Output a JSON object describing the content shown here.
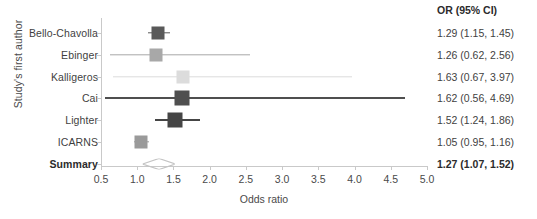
{
  "chart_data": {
    "type": "forest",
    "title": "",
    "xlabel": "Odds ratio",
    "ylabel": "Study's first author",
    "xlim": [
      0.5,
      5.0
    ],
    "xticks": [
      "0.5",
      "1.0",
      "1.5",
      "2.0",
      "2.5",
      "3.0",
      "3.5",
      "4.0",
      "4.5",
      "5.0"
    ],
    "xtick_values": [
      0.5,
      1.0,
      1.5,
      2.0,
      2.5,
      3.0,
      3.5,
      4.0,
      4.5,
      5.0
    ],
    "grid": false,
    "legend": "none",
    "effect_measure": "OR (95% CI)",
    "categories": [
      "Bello-Chavolla",
      "Ebinger",
      "Kalligeros",
      "Cai",
      "Lighter",
      "ICARNS",
      "Summary"
    ],
    "rows": [
      {
        "label": "Bello-Chavolla",
        "or": 1.29,
        "ci_low": 1.15,
        "ci_high": 1.45,
        "text": "1.29 (1.15, 1.45)",
        "marker": "square",
        "color": "#595959",
        "box_size": 13,
        "summary": false
      },
      {
        "label": "Ebinger",
        "or": 1.26,
        "ci_low": 0.62,
        "ci_high": 2.56,
        "text": "1.26 (0.62, 2.56)",
        "marker": "square",
        "color": "#a8a8a8",
        "box_size": 13,
        "summary": false
      },
      {
        "label": "Kalligeros",
        "or": 1.63,
        "ci_low": 0.67,
        "ci_high": 3.97,
        "text": "1.63 (0.67, 3.97)",
        "marker": "square",
        "color": "#dcdcdc",
        "box_size": 13,
        "summary": false
      },
      {
        "label": "Cai",
        "or": 1.62,
        "ci_low": 0.56,
        "ci_high": 4.69,
        "text": "1.62 (0.56, 4.69)",
        "marker": "square",
        "color": "#4f4f4f",
        "box_size": 15,
        "summary": false
      },
      {
        "label": "Lighter",
        "or": 1.52,
        "ci_low": 1.24,
        "ci_high": 1.86,
        "text": "1.52 (1.24, 1.86)",
        "marker": "square",
        "color": "#454545",
        "box_size": 15,
        "summary": false
      },
      {
        "label": "ICARNS",
        "or": 1.05,
        "ci_low": 0.95,
        "ci_high": 1.16,
        "text": "1.05 (0.95, 1.16)",
        "marker": "square",
        "color": "#9a9a9a",
        "box_size": 13,
        "summary": false
      },
      {
        "label": "Summary",
        "or": 1.27,
        "ci_low": 1.07,
        "ci_high": 1.52,
        "text": "1.27 (1.07, 1.52)",
        "marker": "diamond",
        "color": "#c3c3c3",
        "box_size": 0,
        "summary": true
      }
    ]
  },
  "axis": {
    "y_title": "Study's first author",
    "x_title": "Odds ratio"
  },
  "or_column": {
    "header": "OR (95% CI)"
  }
}
